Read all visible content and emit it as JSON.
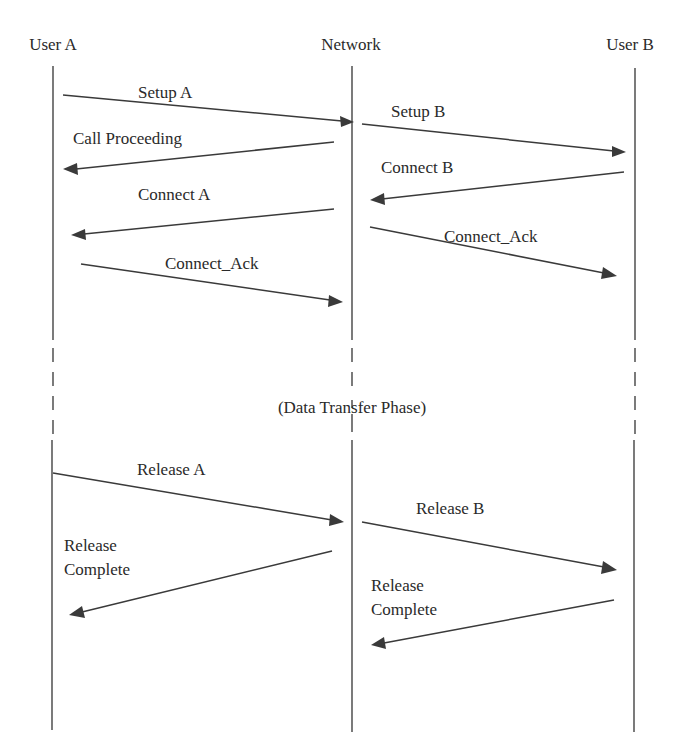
{
  "participants": [
    {
      "id": "A",
      "label": "User A"
    },
    {
      "id": "N",
      "label": "Network"
    },
    {
      "id": "B",
      "label": "User B"
    }
  ],
  "phase_label": "(Data Transfer Phase)",
  "messages": [
    {
      "label": "Setup A",
      "from": "A",
      "to": "N"
    },
    {
      "label": "Call Proceeding",
      "from": "N",
      "to": "A"
    },
    {
      "label": "Setup B",
      "from": "N",
      "to": "B"
    },
    {
      "label": "Connect B",
      "from": "B",
      "to": "N"
    },
    {
      "label": "Connect A",
      "from": "N",
      "to": "A"
    },
    {
      "label": "Connect_Ack",
      "from": "N",
      "to": "B"
    },
    {
      "label": "Connect_Ack",
      "from": "A",
      "to": "N"
    },
    {
      "label": "Release A",
      "from": "A",
      "to": "N"
    },
    {
      "label": "Release B",
      "from": "N",
      "to": "B"
    },
    {
      "label": "Release Complete",
      "label_lines": [
        "Release",
        "Complete"
      ],
      "from": "N",
      "to": "A"
    },
    {
      "label": "Release Complete",
      "label_lines": [
        "Release",
        "Complete"
      ],
      "from": "B",
      "to": "N"
    }
  ]
}
